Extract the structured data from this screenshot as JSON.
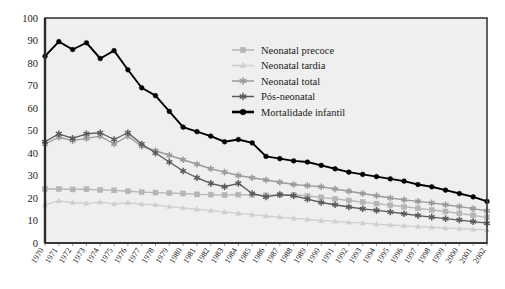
{
  "chart_data": {
    "type": "line",
    "title": "",
    "subtitle": "",
    "xlabel": "",
    "ylabel": "",
    "ylim": [
      0,
      100
    ],
    "ytick_step": 10,
    "grid": false,
    "legend_position": "top-right",
    "x": [
      "1970",
      "1971",
      "1972",
      "1973",
      "1974",
      "1975",
      "1976",
      "1977",
      "1978",
      "1979",
      "1980",
      "1981",
      "1982",
      "1983",
      "1984",
      "1985",
      "1986",
      "1987",
      "1988",
      "1989",
      "1990",
      "1991",
      "1992",
      "1993",
      "1994",
      "1995",
      "1996",
      "1997",
      "1998",
      "1999",
      "2000",
      "2001",
      "2002"
    ],
    "yticks": [
      "0",
      "10",
      "20",
      "30",
      "40",
      "50",
      "60",
      "70",
      "80",
      "90",
      "100"
    ],
    "series": [
      {
        "name": "Neonatal precoce",
        "color": "#b5b5b5",
        "marker": "square",
        "values": [
          24.0,
          24.0,
          23.8,
          23.9,
          23.6,
          23.4,
          23.0,
          22.6,
          22.4,
          22.2,
          22.0,
          21.6,
          21.5,
          21.3,
          21.5,
          21.4,
          21.2,
          21.5,
          21.4,
          21.0,
          20.3,
          19.6,
          18.9,
          18.2,
          17.5,
          16.8,
          16.1,
          15.4,
          14.7,
          14.0,
          13.2,
          12.3,
          11.4
        ]
      },
      {
        "name": "Neonatal tardia",
        "color": "#cfcfcf",
        "marker": "triangle",
        "values": [
          17.0,
          18.7,
          18.0,
          17.6,
          18.2,
          17.4,
          17.9,
          17.3,
          17.0,
          16.2,
          15.6,
          15.0,
          14.4,
          13.8,
          13.2,
          12.6,
          12.0,
          11.5,
          11.0,
          10.5,
          10.0,
          9.6,
          9.2,
          8.8,
          8.4,
          8.0,
          7.6,
          7.3,
          7.0,
          6.7,
          6.4,
          6.1,
          5.8
        ]
      },
      {
        "name": "Neonatal total",
        "color": "#9a9a9a",
        "marker": "star",
        "values": [
          44.0,
          47.0,
          45.5,
          46.5,
          47.5,
          44.0,
          47.5,
          43.0,
          41.0,
          39.0,
          37.0,
          35.0,
          33.0,
          31.5,
          30.0,
          29.0,
          28.0,
          27.0,
          26.0,
          25.5,
          25.0,
          24.0,
          23.0,
          22.0,
          21.0,
          20.0,
          19.2,
          18.5,
          17.8,
          17.0,
          16.2,
          15.3,
          14.3
        ]
      },
      {
        "name": "Pós-neonatal",
        "color": "#5a5a5a",
        "marker": "star",
        "values": [
          45.0,
          48.5,
          46.5,
          48.5,
          49.0,
          46.0,
          49.0,
          44.0,
          40.0,
          36.0,
          32.0,
          29.0,
          26.5,
          25.0,
          26.5,
          22.0,
          20.5,
          21.5,
          21.0,
          19.5,
          18.0,
          17.0,
          16.0,
          15.2,
          14.5,
          13.8,
          13.0,
          12.2,
          11.5,
          10.8,
          10.2,
          9.5,
          8.8
        ]
      },
      {
        "name": "Mortalidade infantil",
        "color": "#000000",
        "marker": "circle",
        "values": [
          83.0,
          89.5,
          86.0,
          89.0,
          82.0,
          85.5,
          77.0,
          69.0,
          65.5,
          58.5,
          51.5,
          49.5,
          47.5,
          45.0,
          46.0,
          44.5,
          38.5,
          37.5,
          36.5,
          36.0,
          34.5,
          33.0,
          31.5,
          30.5,
          29.5,
          28.5,
          27.5,
          26.0,
          25.0,
          23.5,
          22.0,
          20.5,
          18.5
        ]
      }
    ]
  },
  "legend": {
    "items": [
      {
        "label": "Neonatal precoce"
      },
      {
        "label": "Neonatal tardia"
      },
      {
        "label": "Neonatal total"
      },
      {
        "label": "Pós-neonatal"
      },
      {
        "label": "Mortalidade infantil"
      }
    ]
  },
  "colors": {
    "plot_background": "#efefef",
    "frame": "#3a3a3a",
    "axis_text": "#1a1a1a"
  }
}
